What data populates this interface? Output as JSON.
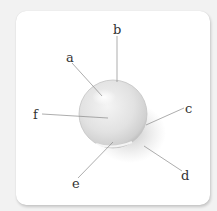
{
  "figure": {
    "labels": [
      {
        "id": "a",
        "text": "a",
        "x": 66,
        "y": 51
      },
      {
        "id": "b",
        "text": "b",
        "x": 113,
        "y": 23
      },
      {
        "id": "c",
        "text": "c",
        "x": 185,
        "y": 102
      },
      {
        "id": "d",
        "text": "d",
        "x": 181,
        "y": 169
      },
      {
        "id": "e",
        "text": "e",
        "x": 72,
        "y": 177
      },
      {
        "id": "f",
        "text": "f",
        "x": 33,
        "y": 108
      }
    ]
  }
}
